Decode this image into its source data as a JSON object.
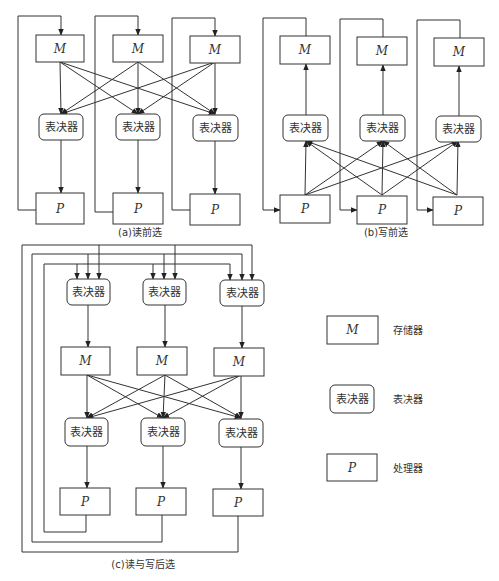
{
  "colors": {
    "stroke": "#333333",
    "background": "#ffffff"
  },
  "labels": {
    "memory": "M",
    "voter": "表决器",
    "processor": "P"
  },
  "panels": [
    {
      "id": "a",
      "caption": "(a)读前选",
      "caption_pos": [
        140,
        236
      ],
      "flow": "M -> voter -> P, P loops back to M",
      "memories": [
        [
          36,
          35,
          48,
          27
        ],
        [
          113,
          35,
          50,
          27
        ],
        [
          190,
          36,
          50,
          27
        ]
      ],
      "voters": [
        [
          39,
          114,
          44,
          26
        ],
        [
          116,
          114,
          44,
          26
        ],
        [
          193,
          115,
          45,
          26
        ]
      ],
      "processors": [
        [
          36,
          193,
          48,
          31
        ],
        [
          113,
          193,
          50,
          31
        ],
        [
          190,
          194,
          50,
          31
        ]
      ],
      "cross": {
        "from_y": 62,
        "to_y": 114,
        "from_x": [
          60,
          138,
          215
        ],
        "to_x": [
          61,
          138,
          215
        ],
        "dir": "down"
      },
      "down_links": [
        [
          61,
          140,
          61,
          193
        ],
        [
          138,
          140,
          138,
          193
        ],
        [
          215,
          141,
          215,
          194
        ]
      ],
      "loops": [
        {
          "pts": [
            [
              36,
              210
            ],
            [
              18,
              210
            ],
            [
              18,
              16
            ],
            [
              61,
              16
            ],
            [
              61,
              35
            ]
          ],
          "arrow_end": true
        },
        {
          "pts": [
            [
              113,
              212
            ],
            [
              95,
              212
            ],
            [
              95,
              16
            ],
            [
              138,
              16
            ],
            [
              138,
              35
            ]
          ],
          "arrow_end": true
        },
        {
          "pts": [
            [
              190,
              210
            ],
            [
              172,
              210
            ],
            [
              172,
              18
            ],
            [
              215,
              18
            ],
            [
              215,
              36
            ]
          ],
          "arrow_end": true
        }
      ]
    },
    {
      "id": "b",
      "caption": "(b)写前选",
      "caption_pos": [
        386,
        236
      ],
      "flow": "P -> voter -> M, M loops back to P",
      "memories": [
        [
          280,
          36,
          50,
          28
        ],
        [
          357,
          37,
          50,
          28
        ],
        [
          434,
          38,
          50,
          28
        ]
      ],
      "voters": [
        [
          283,
          115,
          45,
          26
        ],
        [
          360,
          115,
          45,
          26
        ],
        [
          436,
          116,
          45,
          26
        ]
      ],
      "processors": [
        [
          280,
          195,
          50,
          28
        ],
        [
          357,
          196,
          50,
          28
        ],
        [
          433,
          197,
          50,
          28
        ]
      ],
      "cross": {
        "from_y": 195,
        "to_y": 141,
        "from_x": [
          305,
          382,
          457
        ],
        "to_x": [
          306,
          383,
          458
        ],
        "dir": "up"
      },
      "up_links": [
        [
          306,
          115,
          306,
          64
        ],
        [
          383,
          115,
          383,
          65
        ],
        [
          459,
          116,
          459,
          66
        ]
      ],
      "loops": [
        {
          "pts": [
            [
              306,
              36
            ],
            [
              306,
              18
            ],
            [
              263,
              18
            ],
            [
              263,
              210
            ],
            [
              280,
              210
            ]
          ],
          "arrow_end": true
        },
        {
          "pts": [
            [
              383,
              37
            ],
            [
              383,
              19
            ],
            [
              340,
              19
            ],
            [
              340,
              210
            ],
            [
              357,
              210
            ]
          ],
          "arrow_end": true
        },
        {
          "pts": [
            [
              460,
              38
            ],
            [
              460,
              20
            ],
            [
              417,
              20
            ],
            [
              417,
              210
            ],
            [
              433,
              210
            ]
          ],
          "arrow_end": true
        }
      ]
    },
    {
      "id": "c",
      "caption": "(c)读与写后选",
      "caption_pos": [
        143,
        568
      ],
      "flow": "all P -> top voters -> M -> voters -> P",
      "top_voters": [
        [
          67,
          279,
          43,
          26
        ],
        [
          143,
          279,
          43,
          26
        ],
        [
          220,
          280,
          44,
          26
        ]
      ],
      "memories": [
        [
          61,
          347,
          49,
          28
        ],
        [
          137,
          347,
          50,
          28
        ],
        [
          214,
          348,
          50,
          28
        ]
      ],
      "voters": [
        [
          65,
          418,
          43,
          28
        ],
        [
          141,
          418,
          44,
          28
        ],
        [
          219,
          419,
          44,
          28
        ]
      ],
      "processors": [
        [
          60,
          488,
          50,
          27
        ],
        [
          136,
          488,
          50,
          27
        ],
        [
          213,
          489,
          50,
          27
        ]
      ],
      "cross": {
        "from_y": 375,
        "to_y": 418,
        "from_x": [
          87,
          165,
          241
        ],
        "to_x": [
          87,
          163,
          241
        ],
        "dir": "down"
      },
      "down_links": [
        [
          88,
          305,
          88,
          347
        ],
        [
          165,
          305,
          165,
          347
        ],
        [
          242,
          306,
          242,
          348
        ],
        [
          87,
          446,
          87,
          488
        ],
        [
          163,
          446,
          163,
          488
        ],
        [
          241,
          447,
          241,
          489
        ]
      ],
      "feedback": [
        {
          "pts": [
            [
              86,
              515
            ],
            [
              86,
              532
            ],
            [
              44,
              532
            ],
            [
              44,
              264
            ],
            [
              230,
              264
            ]
          ],
          "drops": [
            77,
            153,
            230
          ],
          "drop_y_top": 264
        },
        {
          "pts": [
            [
              162,
              515
            ],
            [
              162,
              542
            ],
            [
              32,
              542
            ],
            [
              32,
              254
            ],
            [
              242,
              254
            ]
          ],
          "drops": [
            88,
            164,
            242
          ],
          "drop_y_top": 254
        },
        {
          "pts": [
            [
              238,
              516
            ],
            [
              238,
              552
            ],
            [
              22,
              552
            ],
            [
              22,
              245
            ],
            [
              252,
              245
            ]
          ],
          "drops": [
            99,
            175,
            252
          ],
          "drop_y_top": 245
        }
      ]
    }
  ],
  "legend": {
    "items": [
      {
        "shape": "rect",
        "symbol": "M",
        "label": "存储器",
        "box": [
          327,
          316,
          51,
          28
        ],
        "label_pos": [
          393,
          334
        ]
      },
      {
        "shape": "rounded",
        "symbol": "表决器",
        "label": "表决器",
        "box": [
          330,
          385,
          44,
          28
        ],
        "label_pos": [
          393,
          403
        ]
      },
      {
        "shape": "rect",
        "symbol": "P",
        "label": "处理器",
        "box": [
          327,
          454,
          50,
          27
        ],
        "label_pos": [
          393,
          472
        ]
      }
    ]
  }
}
